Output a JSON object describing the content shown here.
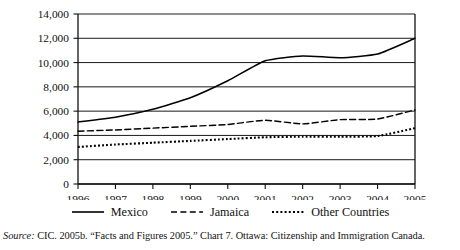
{
  "chart_data": {
    "type": "line",
    "title": "",
    "xlabel": "",
    "ylabel": "",
    "x": [
      1996,
      1997,
      1998,
      1999,
      2000,
      2001,
      2002,
      2003,
      2004,
      2005
    ],
    "categories": [
      "1996",
      "1997",
      "1998",
      "1999",
      "2000",
      "2001",
      "2002",
      "2003",
      "2004",
      "2005"
    ],
    "series": [
      {
        "name": "Mexico",
        "style": "solid",
        "values": [
          5100,
          5500,
          6150,
          7100,
          8500,
          10150,
          10550,
          10400,
          10700,
          12000
        ]
      },
      {
        "name": "Jamaica",
        "style": "dashed",
        "values": [
          4350,
          4450,
          4600,
          4750,
          4900,
          5250,
          4950,
          5300,
          5350,
          6100
        ]
      },
      {
        "name": "Other Countries",
        "style": "dotted",
        "values": [
          3050,
          3250,
          3400,
          3550,
          3700,
          3850,
          3900,
          3900,
          3950,
          4600
        ]
      }
    ],
    "ylim": [
      0,
      14000
    ],
    "xlim": [
      1996,
      2005
    ],
    "ytick_values": [
      0,
      2000,
      4000,
      6000,
      8000,
      10000,
      12000,
      14000
    ],
    "ytick_labels": [
      "0",
      "2,000",
      "4,000",
      "6,000",
      "8,000",
      "10,000",
      "12,000",
      "14,000"
    ],
    "grid": true,
    "grid_axis": "y",
    "legend_position": "bottom",
    "line_color": "#000000"
  },
  "legend": {
    "items": [
      {
        "label": "Mexico",
        "swatch": "solid-line-swatch"
      },
      {
        "label": "Jamaica",
        "swatch": "dashed-line-swatch"
      },
      {
        "label": "Other Countries",
        "swatch": "dotted-line-swatch"
      }
    ]
  },
  "source": {
    "label": "Source:",
    "text": " CIC. 2005b. “Facts and Figures 2005.” Chart 7. Ottawa: Citizenship and Immigration Canada."
  }
}
